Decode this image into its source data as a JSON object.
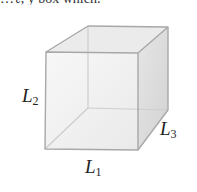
{
  "top_fragment": "…ℓ, y box which.",
  "cube": {
    "edge_color": "#a9a9a9",
    "hidden_edge_color": "#cfcfcf",
    "front_face_color": "#eeeeee",
    "top_face_color": "#e4e4e4",
    "side_face_color": "#dadada"
  },
  "labels": {
    "l1": {
      "base": "L",
      "sub": "1"
    },
    "l2": {
      "base": "L",
      "sub": "2"
    },
    "l3": {
      "base": "L",
      "sub": "3"
    }
  }
}
